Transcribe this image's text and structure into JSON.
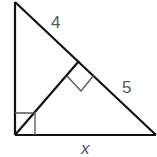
{
  "diagram": {
    "colors": {
      "stroke": "#111111",
      "marker": "#555555",
      "label": "#555555",
      "background": "#ffffff"
    },
    "labels": {
      "upper_hypotenuse_segment": "4",
      "lower_hypotenuse_segment": "5",
      "base": "x"
    },
    "right_angle_markers": 2
  }
}
